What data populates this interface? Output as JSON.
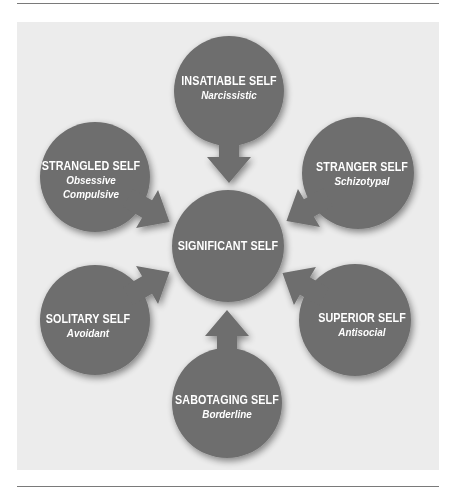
{
  "colors": {
    "node": "#6e6e6e",
    "panel": "#ececec",
    "text": "#ffffff",
    "rule": "#7a7a7a"
  },
  "center": {
    "title": "SIGNIFICANT SELF"
  },
  "nodes": [
    {
      "id": "insatiable",
      "title": "INSATIABLE SELF",
      "subtitle": "Narcissistic"
    },
    {
      "id": "strangled",
      "title": "STRANGLED SELF",
      "subtitle_line1": "Obsessive",
      "subtitle_line2": "Compulsive"
    },
    {
      "id": "stranger",
      "title": "STRANGER SELF",
      "subtitle": "Schizotypal"
    },
    {
      "id": "solitary",
      "title": "SOLITARY SELF",
      "subtitle": "Avoidant"
    },
    {
      "id": "superior",
      "title": "SUPERIOR SELF",
      "subtitle": "Antisocial"
    },
    {
      "id": "sabotaging",
      "title": "SABOTAGING SELF",
      "subtitle": "Borderline"
    }
  ]
}
